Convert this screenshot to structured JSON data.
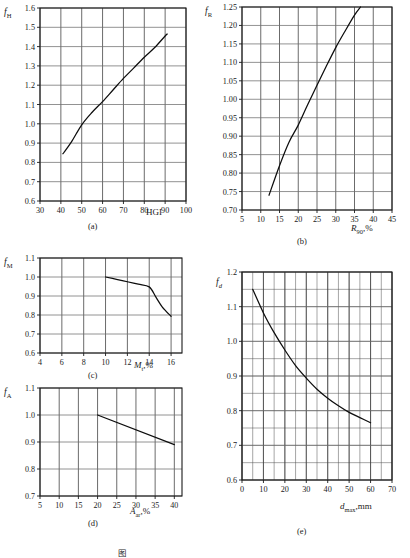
{
  "figure": {
    "caption_partial": "图",
    "panels": [
      "(a)",
      "(b)",
      "(c)",
      "(d)",
      "(e)"
    ]
  },
  "chart_data": [
    {
      "id": "a",
      "type": "line",
      "panel_label": "(a)",
      "title": "",
      "xlabel": "HGI",
      "ylabel": "f_H",
      "ylabel_base": "f",
      "ylabel_sub": "H",
      "xlim": [
        30,
        100
      ],
      "ylim": [
        0.6,
        1.6
      ],
      "xticks": [
        30,
        40,
        50,
        60,
        70,
        80,
        90,
        100
      ],
      "yticks": [
        0.6,
        0.7,
        0.8,
        0.9,
        1.0,
        1.1,
        1.2,
        1.3,
        1.4,
        1.5,
        1.6
      ],
      "xtick_labels": [
        "30",
        "40",
        "50",
        "60",
        "70",
        "80",
        "90",
        "100"
      ],
      "ytick_labels": [
        "0.6",
        "0.7",
        "0.8",
        "0.9",
        "1.0",
        "1.1",
        "1.2",
        "1.3",
        "1.4",
        "1.5",
        "1.6"
      ],
      "grid": true,
      "legend": null,
      "series": [
        {
          "name": "f_H vs HGI",
          "x": [
            41,
            45,
            50,
            55,
            60,
            65,
            70,
            75,
            80,
            85,
            90,
            91
          ],
          "y": [
            0.845,
            0.905,
            0.995,
            1.06,
            1.115,
            1.175,
            1.235,
            1.29,
            1.345,
            1.395,
            1.455,
            1.465
          ]
        }
      ]
    },
    {
      "id": "b",
      "type": "line",
      "panel_label": "(b)",
      "title": "",
      "xlabel": "R_90,%",
      "xlabel_base": "R",
      "xlabel_sub": "90",
      "xlabel_unit": ",%",
      "ylabel": "f_R",
      "ylabel_base": "f",
      "ylabel_sub": "R",
      "xlim": [
        5,
        45
      ],
      "ylim": [
        0.7,
        1.25
      ],
      "xticks": [
        5,
        10,
        15,
        20,
        25,
        30,
        35,
        40,
        45
      ],
      "yticks": [
        0.7,
        0.75,
        0.8,
        0.85,
        0.9,
        0.95,
        1.0,
        1.05,
        1.1,
        1.15,
        1.2,
        1.25
      ],
      "xtick_labels": [
        "5",
        "10",
        "15",
        "20",
        "25",
        "30",
        "35",
        "40",
        "45"
      ],
      "ytick_labels": [
        "0.70",
        "0.75",
        "0.80",
        "0.85",
        "0.90",
        "0.95",
        "1.00",
        "1.05",
        "1.10",
        "1.15",
        "1.20",
        "1.25"
      ],
      "grid": true,
      "legend": null,
      "series": [
        {
          "name": "f_R vs R90",
          "x": [
            12.2,
            15,
            17.5,
            20,
            22.5,
            25,
            27.5,
            30,
            32.5,
            35,
            36.6
          ],
          "y": [
            0.74,
            0.82,
            0.883,
            0.93,
            0.985,
            1.038,
            1.09,
            1.14,
            1.185,
            1.228,
            1.25
          ]
        }
      ]
    },
    {
      "id": "c",
      "type": "line",
      "panel_label": "(c)",
      "title": "",
      "xlabel": "M_t,%",
      "xlabel_base": "M",
      "xlabel_sub": "t",
      "xlabel_unit": ",%",
      "ylabel": "f_M",
      "ylabel_base": "f",
      "ylabel_sub": "M",
      "xlim": [
        4,
        17
      ],
      "ylim": [
        0.6,
        1.1
      ],
      "xticks": [
        4,
        6,
        8,
        10,
        12,
        14,
        16
      ],
      "yticks": [
        0.6,
        0.7,
        0.8,
        0.9,
        1.0,
        1.1
      ],
      "xtick_labels": [
        "4",
        "6",
        "8",
        "10",
        "12",
        "14",
        "16"
      ],
      "ytick_labels": [
        "0.6",
        "0.7",
        "0.8",
        "0.9",
        "1.0",
        "1.1"
      ],
      "grid": true,
      "legend": null,
      "series": [
        {
          "name": "f_M vs Mt",
          "x": [
            10,
            11,
            12,
            13,
            14,
            14.6,
            15.2,
            16
          ],
          "y": [
            1.0,
            0.988,
            0.975,
            0.962,
            0.948,
            0.895,
            0.842,
            0.793
          ]
        }
      ]
    },
    {
      "id": "d",
      "type": "line",
      "panel_label": "(d)",
      "title": "",
      "xlabel": "A_ar,%",
      "xlabel_base": "A",
      "xlabel_sub": "ar",
      "xlabel_unit": ",%",
      "ylabel": "f_A",
      "ylabel_base": "f",
      "ylabel_sub": "A",
      "xlim": [
        5,
        42
      ],
      "ylim": [
        0.7,
        1.1
      ],
      "xticks": [
        5,
        10,
        15,
        20,
        25,
        30,
        35,
        40
      ],
      "yticks": [
        0.7,
        0.8,
        0.9,
        1.0,
        1.1
      ],
      "xtick_labels": [
        "5",
        "10",
        "15",
        "20",
        "25",
        "30",
        "35",
        "40"
      ],
      "ytick_labels": [
        "0.7",
        "0.8",
        "0.9",
        "1.0",
        "1.1"
      ],
      "grid": true,
      "legend": null,
      "series": [
        {
          "name": "f_A vs Aar",
          "x": [
            20,
            40
          ],
          "y": [
            1.0,
            0.89
          ]
        }
      ]
    },
    {
      "id": "e",
      "type": "line",
      "panel_label": "(e)",
      "title": "",
      "xlabel": "d_max,mm",
      "xlabel_base": "d",
      "xlabel_sub": "max",
      "xlabel_unit": ",mm",
      "ylabel": "f_d",
      "ylabel_base": "f",
      "ylabel_sub": "d",
      "xlim": [
        0,
        70
      ],
      "ylim": [
        0.6,
        1.2
      ],
      "xticks": [
        0,
        10,
        20,
        30,
        40,
        50,
        60,
        70
      ],
      "yticks": [
        0.6,
        0.7,
        0.8,
        0.9,
        1.0,
        1.1,
        1.2
      ],
      "xtick_labels": [
        "0",
        "10",
        "20",
        "30",
        "40",
        "50",
        "60",
        "70"
      ],
      "ytick_labels": [
        "0.6",
        "0.7",
        "0.8",
        "0.9",
        "1.0",
        "1.1",
        "1.2"
      ],
      "minor_grid": true,
      "minor_x_step": 5,
      "minor_y_step": 0.05,
      "grid": true,
      "legend": null,
      "series": [
        {
          "name": "f_d vs dmax",
          "x": [
            5,
            10,
            15,
            20,
            25,
            30,
            35,
            40,
            45,
            50,
            55,
            60
          ],
          "y": [
            1.15,
            1.082,
            1.025,
            0.975,
            0.93,
            0.894,
            0.862,
            0.836,
            0.814,
            0.795,
            0.78,
            0.765
          ]
        }
      ]
    }
  ]
}
